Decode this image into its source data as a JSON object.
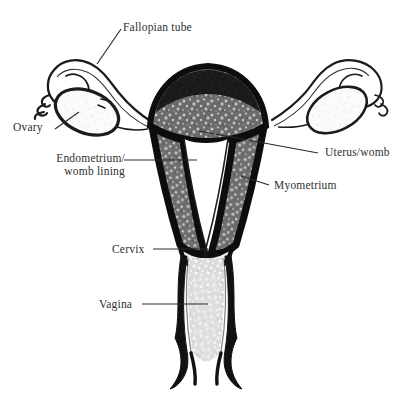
{
  "diagram": {
    "background_color": "#ffffff",
    "ink_color": "#111111",
    "text_color": "#2f2f2f",
    "myometrium_fill": "#6e6e6e",
    "endometrium_fill": "#ffffff",
    "vagina_fill": "#d8d8d8",
    "labels": [
      {
        "key": "fallopian_tube",
        "text": "Fallopian tube",
        "x": 123,
        "y": 21,
        "leader": {
          "x1": 121,
          "y1": 29,
          "x2": 97,
          "y2": 64
        }
      },
      {
        "key": "ovary",
        "text": "Ovary",
        "x": 13,
        "y": 121,
        "leader": {
          "x1": 55,
          "y1": 129,
          "x2": 79,
          "y2": 112
        }
      },
      {
        "key": "endometrium",
        "line1": "Endometrium/",
        "line2": "womb lining",
        "x": 25,
        "y": 152,
        "leader": {
          "x1": 124,
          "y1": 160,
          "x2": 197,
          "y2": 160
        }
      },
      {
        "key": "uterus_womb",
        "text": "Uterus/womb",
        "x": 325,
        "y": 146,
        "leader": {
          "x1": 318,
          "y1": 153,
          "x2": 199,
          "y2": 131
        }
      },
      {
        "key": "myometrium",
        "text": "Myometrium",
        "x": 274,
        "y": 179,
        "leader": {
          "x1": 269,
          "y1": 185,
          "x2": 241,
          "y2": 176
        }
      },
      {
        "key": "cervix",
        "text": "Cervix",
        "x": 112,
        "y": 243,
        "leader": {
          "x1": 153,
          "y1": 249,
          "x2": 208,
          "y2": 249
        }
      },
      {
        "key": "vagina",
        "text": "Vagina",
        "x": 99,
        "y": 298,
        "leader": {
          "x1": 142,
          "y1": 304,
          "x2": 208,
          "y2": 304
        }
      }
    ],
    "structures": [
      {
        "key": "uterine_fundus",
        "name": "uterine fundus"
      },
      {
        "key": "uterine_body_left_wall",
        "name": "left myometrial wall"
      },
      {
        "key": "uterine_body_right_wall",
        "name": "right myometrial wall"
      },
      {
        "key": "uterine_cavity",
        "name": "endometrial cavity"
      },
      {
        "key": "cervix_canal",
        "name": "cervical canal"
      },
      {
        "key": "vaginal_canal",
        "name": "vaginal canal"
      },
      {
        "key": "left_fallopian_tube",
        "name": "left fallopian tube"
      },
      {
        "key": "right_fallopian_tube",
        "name": "right fallopian tube"
      },
      {
        "key": "left_ovary",
        "name": "left ovary"
      },
      {
        "key": "right_ovary",
        "name": "right ovary"
      },
      {
        "key": "left_fimbriae",
        "name": "left fimbriae"
      },
      {
        "key": "right_fimbriae",
        "name": "right fimbriae"
      }
    ]
  }
}
